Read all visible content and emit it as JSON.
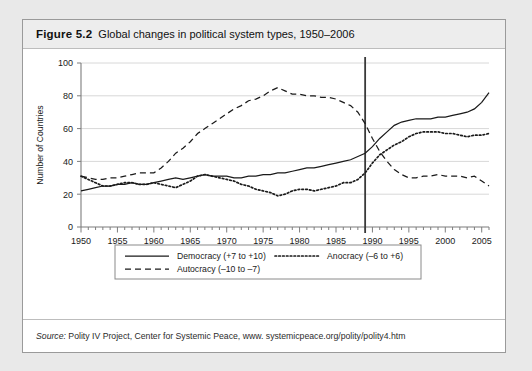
{
  "figure": {
    "number": "Figure 5.2",
    "title": "Global changes in political system types, 1950–2006"
  },
  "source": {
    "label": "Source:",
    "text": " Polity IV Project, Center for Systemic Peace, www. systemicpeace.org/polity/polity4.htm"
  },
  "legend": {
    "items": [
      {
        "label": "Democracy (+7 to +10)",
        "style": "solid"
      },
      {
        "label": "Anocracy (–6 to +6)",
        "style": "dotted"
      },
      {
        "label": "Autocracy (–10 to –7)",
        "style": "dashed"
      }
    ]
  },
  "chart_data": {
    "type": "line",
    "title": "Global changes in political system types, 1950–2006",
    "xlabel": "",
    "ylabel": "Number of Countries",
    "xlim": [
      1950,
      2006
    ],
    "ylim": [
      0,
      100
    ],
    "ytick_labels": [
      "0",
      "20",
      "40",
      "60",
      "80",
      "100"
    ],
    "yticks": [
      0,
      20,
      40,
      60,
      80,
      100
    ],
    "xtick_labels": [
      "1950",
      "1955",
      "1960",
      "1965",
      "1970",
      "1975",
      "1980",
      "1985",
      "1990",
      "1995",
      "2000",
      "2005"
    ],
    "xticks": [
      1950,
      1955,
      1960,
      1965,
      1970,
      1975,
      1980,
      1985,
      1990,
      1995,
      2000,
      2005
    ],
    "minor_xtick_step": 1,
    "grid": "horizontal",
    "legend_position": "below-axes",
    "annotations": [
      {
        "type": "vertical-line",
        "x": 1989,
        "label": "1989 reference line"
      }
    ],
    "x": [
      1950,
      1951,
      1952,
      1953,
      1954,
      1955,
      1956,
      1957,
      1958,
      1959,
      1960,
      1961,
      1962,
      1963,
      1964,
      1965,
      1966,
      1967,
      1968,
      1969,
      1970,
      1971,
      1972,
      1973,
      1974,
      1975,
      1976,
      1977,
      1978,
      1979,
      1980,
      1981,
      1982,
      1983,
      1984,
      1985,
      1986,
      1987,
      1988,
      1989,
      1990,
      1991,
      1992,
      1993,
      1994,
      1995,
      1996,
      1997,
      1998,
      1999,
      2000,
      2001,
      2002,
      2003,
      2004,
      2005,
      2006
    ],
    "series": [
      {
        "name": "Democracy (+7 to +10)",
        "style": "solid",
        "values": [
          22,
          23,
          24,
          25,
          25,
          26,
          26,
          27,
          26,
          26,
          27,
          28,
          29,
          30,
          29,
          30,
          31,
          32,
          31,
          31,
          31,
          30,
          30,
          31,
          31,
          32,
          32,
          33,
          33,
          34,
          35,
          36,
          36,
          37,
          38,
          39,
          40,
          41,
          43,
          45,
          49,
          54,
          58,
          62,
          64,
          65,
          66,
          66,
          66,
          67,
          67,
          68,
          69,
          70,
          72,
          76,
          82
        ]
      },
      {
        "name": "Anocracy (–6 to +6)",
        "style": "dotted",
        "values": [
          31,
          29,
          27,
          25,
          25,
          26,
          27,
          27,
          26,
          26,
          27,
          26,
          25,
          24,
          26,
          28,
          31,
          32,
          31,
          30,
          29,
          28,
          26,
          25,
          23,
          22,
          21,
          19,
          20,
          22,
          23,
          23,
          22,
          23,
          24,
          25,
          27,
          27,
          29,
          33,
          39,
          44,
          47,
          50,
          52,
          55,
          57,
          58,
          58,
          58,
          57,
          57,
          56,
          55,
          56,
          56,
          57
        ]
      },
      {
        "name": "Autocracy (–10 to –7)",
        "style": "dashed",
        "values": [
          31,
          30,
          29,
          29,
          30,
          30,
          31,
          32,
          33,
          33,
          33,
          36,
          40,
          45,
          48,
          52,
          57,
          60,
          63,
          66,
          69,
          72,
          74,
          77,
          78,
          80,
          83,
          85,
          83,
          81,
          81,
          80,
          80,
          79,
          79,
          78,
          76,
          74,
          70,
          63,
          54,
          46,
          40,
          35,
          32,
          30,
          30,
          31,
          31,
          32,
          31,
          31,
          31,
          30,
          31,
          28,
          25
        ]
      }
    ]
  }
}
